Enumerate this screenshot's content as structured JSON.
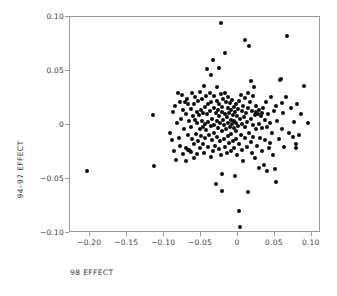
{
  "chart_data": {
    "type": "scatter",
    "title": "",
    "xlabel": "98 EFFECT",
    "ylabel": "94–97 EFFECT",
    "xlim": [
      -0.2275,
      0.1125
    ],
    "ylim": [
      -0.1,
      0.1
    ],
    "xticks": [
      -0.2,
      -0.15,
      -0.1,
      -0.05,
      0,
      0.05,
      0.1
    ],
    "xticklabels": [
      "−0.20",
      "−0.15",
      "−0.10",
      "−0.05",
      "0",
      "0.05",
      "0.10"
    ],
    "yticks": [
      0.1,
      0.05,
      0,
      -0.05,
      -0.1
    ],
    "yticklabels": [
      "0.10",
      "0.05",
      "0",
      "−0.05",
      "−0.10"
    ],
    "grid": false,
    "legend": null,
    "marker": "filled-circle",
    "marker_color": "#0b0b0b",
    "marker_size_px": 4,
    "frame_color": "#9a9a9a",
    "n_points": 203,
    "points": [
      [
        -0.205,
        -0.043
      ],
      [
        -0.115,
        0.009
      ],
      [
        -0.114,
        -0.038
      ],
      [
        -0.092,
        -0.007
      ],
      [
        -0.09,
        -0.014
      ],
      [
        -0.088,
        0.012
      ],
      [
        -0.086,
        -0.024
      ],
      [
        -0.085,
        0.018
      ],
      [
        -0.084,
        -0.032
      ],
      [
        -0.082,
        0.002
      ],
      [
        -0.081,
        0.03
      ],
      [
        -0.08,
        -0.012
      ],
      [
        -0.079,
        0.021
      ],
      [
        -0.078,
        -0.019
      ],
      [
        -0.077,
        0.006
      ],
      [
        -0.076,
        0.028
      ],
      [
        -0.075,
        -0.027
      ],
      [
        -0.074,
        0.014
      ],
      [
        -0.073,
        -0.004
      ],
      [
        -0.072,
        0.021
      ],
      [
        -0.071,
        -0.021
      ],
      [
        -0.07,
        0.01
      ],
      [
        -0.07,
        -0.033
      ],
      [
        -0.069,
        0.024
      ],
      [
        -0.068,
        -0.009
      ],
      [
        -0.068,
        -0.023
      ],
      [
        -0.067,
        0.019
      ],
      [
        -0.066,
        -0.023
      ],
      [
        -0.066,
        0.004
      ],
      [
        -0.065,
        -0.024
      ],
      [
        -0.064,
        0.015
      ],
      [
        -0.064,
        -0.002
      ],
      [
        -0.063,
        -0.025
      ],
      [
        -0.062,
        0.03
      ],
      [
        -0.062,
        -0.013
      ],
      [
        -0.061,
        0.008
      ],
      [
        -0.06,
        -0.031
      ],
      [
        -0.06,
        0.019
      ],
      [
        -0.059,
        -0.018
      ],
      [
        -0.058,
        0.005
      ],
      [
        -0.058,
        0.026
      ],
      [
        -0.057,
        -0.008
      ],
      [
        -0.056,
        0.012
      ],
      [
        -0.056,
        -0.027
      ],
      [
        -0.055,
        0.002
      ],
      [
        -0.054,
        0.022
      ],
      [
        -0.054,
        -0.015
      ],
      [
        -0.053,
        0.009
      ],
      [
        -0.052,
        -0.004
      ],
      [
        -0.052,
        0.031
      ],
      [
        -0.051,
        -0.021
      ],
      [
        -0.05,
        0.014
      ],
      [
        -0.05,
        -0.01
      ],
      [
        -0.049,
        0.004
      ],
      [
        -0.049,
        0.024
      ],
      [
        -0.048,
        -0.018
      ],
      [
        -0.047,
        0.011
      ],
      [
        -0.047,
        -0.002
      ],
      [
        -0.046,
        0.036
      ],
      [
        -0.046,
        -0.026
      ],
      [
        -0.045,
        0.017
      ],
      [
        -0.045,
        0.001
      ],
      [
        -0.044,
        -0.012
      ],
      [
        -0.043,
        0.027
      ],
      [
        -0.043,
        -0.005
      ],
      [
        -0.042,
        0.052
      ],
      [
        -0.042,
        0.01
      ],
      [
        -0.041,
        -0.02
      ],
      [
        -0.04,
        0.019
      ],
      [
        -0.04,
        0.003
      ],
      [
        -0.039,
        -0.009
      ],
      [
        -0.038,
        0.03
      ],
      [
        -0.038,
        0.013
      ],
      [
        -0.037,
        -0.03
      ],
      [
        -0.037,
        -0.001
      ],
      [
        -0.036,
        0.046
      ],
      [
        -0.036,
        0.021
      ],
      [
        -0.035,
        -0.014
      ],
      [
        -0.035,
        0.006
      ],
      [
        -0.034,
        0.06
      ],
      [
        -0.034,
        -0.024
      ],
      [
        -0.033,
        0.016
      ],
      [
        -0.033,
        0.0
      ],
      [
        -0.032,
        -0.007
      ],
      [
        -0.032,
        0.027
      ],
      [
        -0.031,
        -0.019
      ],
      [
        -0.03,
        0.011
      ],
      [
        -0.03,
        -0.055
      ],
      [
        -0.029,
        0.004
      ],
      [
        -0.029,
        0.022
      ],
      [
        -0.028,
        -0.011
      ],
      [
        -0.028,
        0.035
      ],
      [
        -0.027,
        0.014
      ],
      [
        -0.027,
        -0.003
      ],
      [
        -0.026,
        0.053
      ],
      [
        -0.026,
        -0.022
      ],
      [
        -0.025,
        0.008
      ],
      [
        -0.025,
        0.019
      ],
      [
        -0.024,
        -0.015
      ],
      [
        -0.024,
        0.002
      ],
      [
        -0.023,
        0.094
      ],
      [
        -0.023,
        0.029
      ],
      [
        -0.023,
        -0.028
      ],
      [
        -0.022,
        0.012
      ],
      [
        -0.022,
        -0.006
      ],
      [
        -0.021,
        0.017
      ],
      [
        -0.021,
        -0.045
      ],
      [
        -0.021,
        -0.061
      ],
      [
        -0.02,
        0.005
      ],
      [
        -0.02,
        0.024
      ],
      [
        -0.019,
        -0.013
      ],
      [
        -0.019,
        0.0
      ],
      [
        -0.018,
        0.03
      ],
      [
        -0.018,
        -0.02
      ],
      [
        -0.017,
        0.01
      ],
      [
        -0.017,
        0.067
      ],
      [
        -0.016,
        -0.004
      ],
      [
        -0.016,
        0.021
      ],
      [
        -0.015,
        -0.026
      ],
      [
        -0.015,
        0.007
      ],
      [
        -0.014,
        0.016
      ],
      [
        -0.014,
        -0.01
      ],
      [
        -0.013,
        0.002
      ],
      [
        -0.013,
        0.026
      ],
      [
        -0.012,
        -0.017
      ],
      [
        -0.012,
        0.011
      ],
      [
        -0.011,
        -0.002
      ],
      [
        -0.011,
        0.02
      ],
      [
        -0.01,
        -0.024
      ],
      [
        -0.01,
        0.005
      ],
      [
        -0.009,
        0.014
      ],
      [
        -0.009,
        -0.008
      ],
      [
        -0.008,
        0.001
      ],
      [
        -0.008,
        0.023
      ],
      [
        -0.007,
        -0.015
      ],
      [
        -0.007,
        0.009
      ],
      [
        -0.006,
        -0.003
      ],
      [
        -0.006,
        0.017
      ],
      [
        -0.005,
        -0.021
      ],
      [
        -0.005,
        0.004
      ],
      [
        -0.004,
        0.012
      ],
      [
        -0.004,
        -0.047
      ],
      [
        -0.003,
        -0.006
      ],
      [
        -0.003,
        0.019
      ],
      [
        -0.002,
        0.002
      ],
      [
        -0.002,
        -0.013
      ],
      [
        -0.001,
        0.008
      ],
      [
        -0.001,
        -0.028
      ],
      [
        0.0,
        0.015
      ],
      [
        0.0,
        -0.001
      ],
      [
        0.001,
        -0.08
      ],
      [
        0.001,
        0.022
      ],
      [
        0.002,
        -0.018
      ],
      [
        0.003,
        -0.094
      ],
      [
        0.003,
        0.006
      ],
      [
        0.004,
        -0.009
      ],
      [
        0.004,
        0.028
      ],
      [
        0.005,
        0.013
      ],
      [
        0.005,
        -0.023
      ],
      [
        0.006,
        0.001
      ],
      [
        0.007,
        0.018
      ],
      [
        0.007,
        -0.033
      ],
      [
        0.008,
        0.007
      ],
      [
        0.009,
        -0.012
      ],
      [
        0.009,
        0.025
      ],
      [
        0.01,
        -0.002
      ],
      [
        0.01,
        0.079
      ],
      [
        0.011,
        0.011
      ],
      [
        0.012,
        -0.02
      ],
      [
        0.012,
        0.003
      ],
      [
        0.013,
        0.03
      ],
      [
        0.013,
        -0.062
      ],
      [
        0.014,
        0.016
      ],
      [
        0.015,
        -0.007
      ],
      [
        0.015,
        0.073
      ],
      [
        0.016,
        0.021
      ],
      [
        0.017,
        -0.016
      ],
      [
        0.017,
        0.006
      ],
      [
        0.018,
        0.041
      ],
      [
        0.019,
        -0.026
      ],
      [
        0.019,
        0.013
      ],
      [
        0.02,
        0.0
      ],
      [
        0.021,
        0.027
      ],
      [
        0.021,
        -0.011
      ],
      [
        0.022,
        0.035
      ],
      [
        0.023,
        0.009
      ],
      [
        0.023,
        -0.031
      ],
      [
        0.024,
        0.018
      ],
      [
        0.025,
        -0.004
      ],
      [
        0.025,
        0.012
      ],
      [
        0.026,
        -0.019
      ],
      [
        0.027,
        0.01
      ],
      [
        0.028,
        0.001
      ],
      [
        0.028,
        -0.04
      ],
      [
        0.029,
        0.014
      ],
      [
        0.03,
        -0.012
      ],
      [
        0.031,
        0.008
      ],
      [
        0.032,
        -0.024
      ],
      [
        0.032,
        0.011
      ],
      [
        0.033,
        -0.003
      ],
      [
        0.034,
        0.016
      ],
      [
        0.035,
        -0.037
      ],
      [
        0.036,
        0.005
      ],
      [
        0.037,
        -0.014
      ],
      [
        0.038,
        0.021
      ],
      [
        0.039,
        -0.043
      ],
      [
        0.04,
        -0.002
      ],
      [
        0.041,
        0.01
      ],
      [
        0.042,
        -0.021
      ],
      [
        0.043,
        0.002
      ],
      [
        0.044,
        -0.017
      ],
      [
        0.045,
        0.026
      ],
      [
        0.046,
        -0.007
      ],
      [
        0.048,
        -0.028
      ],
      [
        0.049,
        0.013
      ],
      [
        0.05,
        -0.041
      ],
      [
        0.051,
        0.018
      ],
      [
        0.052,
        -0.053
      ],
      [
        0.053,
        0.004
      ],
      [
        0.055,
        -0.013
      ],
      [
        0.057,
        0.042
      ],
      [
        0.058,
        0.043
      ],
      [
        0.059,
        0.02
      ],
      [
        0.06,
        -0.004
      ],
      [
        0.061,
        0.011
      ],
      [
        0.063,
        -0.02
      ],
      [
        0.065,
        0.026
      ],
      [
        0.067,
        0.082
      ],
      [
        0.069,
        -0.007
      ],
      [
        0.072,
        0.016
      ],
      [
        0.074,
        -0.011
      ],
      [
        0.076,
        0.003
      ],
      [
        0.078,
        -0.018
      ],
      [
        0.079,
        -0.021
      ],
      [
        0.08,
        0.019
      ],
      [
        0.083,
        -0.009
      ],
      [
        0.086,
        0.01
      ],
      [
        0.09,
        0.036
      ],
      [
        0.095,
        0.002
      ]
    ]
  }
}
